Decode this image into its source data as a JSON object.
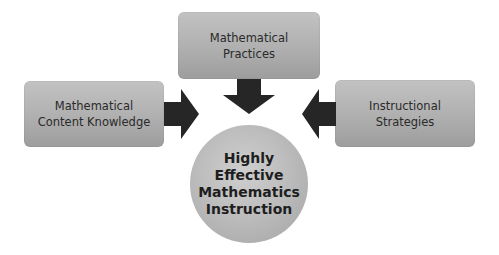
{
  "diagram": {
    "top_box": {
      "line1": "Mathematical",
      "line2": "Practices"
    },
    "left_box": {
      "line1": "Mathematical",
      "line2": "Content Knowledge"
    },
    "right_box": {
      "line1": "Instructional",
      "line2": "Strategies"
    },
    "center": {
      "line1": "Highly",
      "line2": "Effective",
      "line3": "Mathematics",
      "line4": "Instruction"
    },
    "arrows": [
      {
        "from": "left_box",
        "to": "center",
        "direction": "right"
      },
      {
        "from": "top_box",
        "to": "center",
        "direction": "down"
      },
      {
        "from": "right_box",
        "to": "center",
        "direction": "left"
      }
    ],
    "colors": {
      "box_fill": "#b3b3b3",
      "arrow_fill": "#262626",
      "text": "#2a2a2a"
    }
  }
}
